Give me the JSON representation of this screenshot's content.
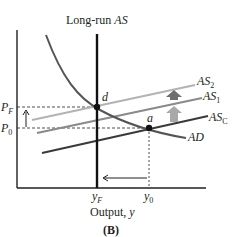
{
  "diagram": {
    "panel_label": "(B)",
    "title": "Long-run AS",
    "title_parts": {
      "normal": "Long-run ",
      "italic": "AS"
    },
    "x_axis_label": "Output, y",
    "x_axis_label_parts": {
      "normal": "Output, ",
      "italic": "y"
    },
    "x_ticks": [
      {
        "base": "y",
        "sub": "F"
      },
      {
        "base": "y",
        "sub": "0"
      }
    ],
    "y_ticks": [
      {
        "base": "P",
        "sub": "F"
      },
      {
        "base": "P",
        "sub": "0"
      }
    ],
    "curves": [
      {
        "name": "AS",
        "sub": "2",
        "color": "#b3b3b3"
      },
      {
        "name": "AS",
        "sub": "1",
        "color": "#8a8a8a"
      },
      {
        "name": "AS",
        "sub": "C",
        "color": "#3a3a3a"
      },
      {
        "name": "AD",
        "sub": "",
        "color": "#555555"
      }
    ],
    "points": [
      {
        "label": "d"
      },
      {
        "label": "a"
      }
    ],
    "colors": {
      "axis": "#231f20",
      "lras": "#111111",
      "shift_arrow_dark": "#6e6e6e",
      "shift_arrow_light": "#a8a8a8"
    }
  }
}
